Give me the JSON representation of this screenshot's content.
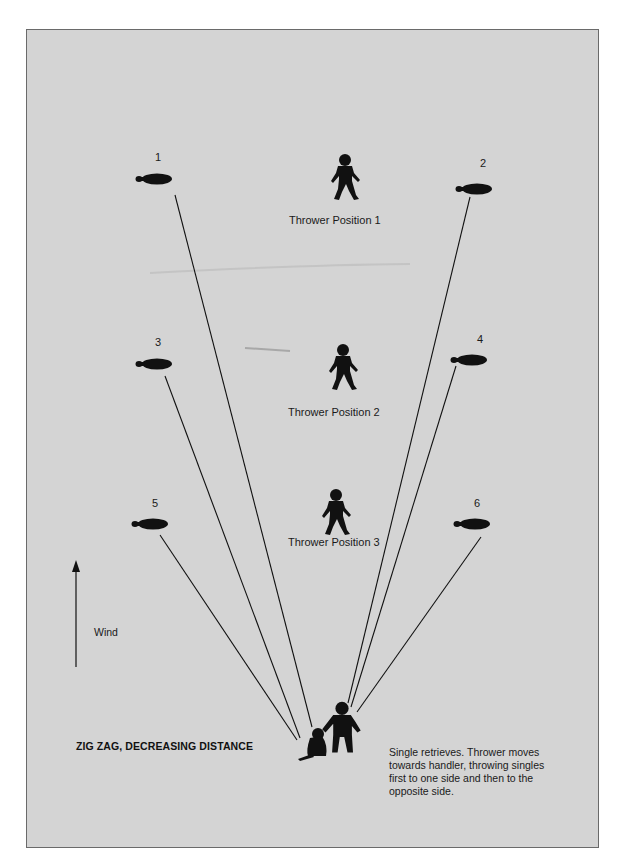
{
  "diagram": {
    "title": "ZIG ZAG, DECREASING DISTANCE",
    "description": "Single retrieves. Thrower moves towards handler, throwing singles first to one side and then to the opposite side.",
    "wind_label": "Wind",
    "colors": {
      "background": "#d4d4d4",
      "ink": "#111111",
      "frame_border": "#6a6a6a"
    },
    "throwers": [
      {
        "label": "Thrower Position 1",
        "icon": "person-icon"
      },
      {
        "label": "Thrower Position 2",
        "icon": "person-icon"
      },
      {
        "label": "Thrower Position 3",
        "icon": "person-icon"
      }
    ],
    "bumpers": [
      {
        "number": "1",
        "side": "left",
        "icon": "bumper-icon"
      },
      {
        "number": "2",
        "side": "right",
        "icon": "bumper-icon"
      },
      {
        "number": "3",
        "side": "left",
        "icon": "bumper-icon"
      },
      {
        "number": "4",
        "side": "right",
        "icon": "bumper-icon"
      },
      {
        "number": "5",
        "side": "left",
        "icon": "bumper-icon"
      },
      {
        "number": "6",
        "side": "right",
        "icon": "bumper-icon"
      }
    ],
    "handler": {
      "icon": "handler-icon"
    },
    "dog": {
      "icon": "dog-icon"
    }
  }
}
